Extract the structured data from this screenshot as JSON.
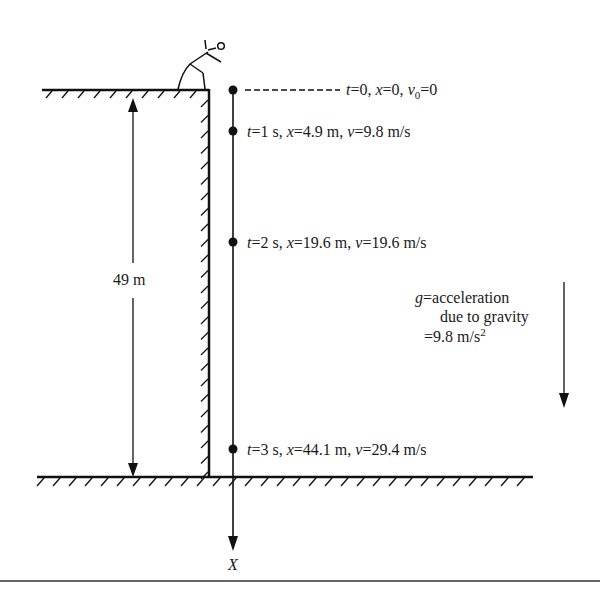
{
  "diagram": {
    "height_label": "49 m",
    "axis_label": "X",
    "points": [
      {
        "t_label": "t",
        "t_val": "=0, ",
        "x_label": "x",
        "x_val": "=0, ",
        "v_label": "v",
        "v_sub": "0",
        "v_val": "=0"
      },
      {
        "t_label": "t",
        "t_val": "=1 s, ",
        "x_label": "x",
        "x_val": "=4.9 m, ",
        "v_label": "v",
        "v_val": "=9.8 m/s"
      },
      {
        "t_label": "t",
        "t_val": "=2 s, ",
        "x_label": "x",
        "x_val": "=19.6 m, ",
        "v_label": "v",
        "v_val": "=19.6 m/s"
      },
      {
        "t_label": "t",
        "t_val": "=3 s, ",
        "x_label": "x",
        "x_val": "=44.1 m, ",
        "v_label": "v",
        "v_val": "=29.4 m/s"
      }
    ],
    "gravity": {
      "symbol": "g",
      "line1": "=acceleration",
      "line2": "due to gravity",
      "line3": "=9.8 m/s",
      "line3_sup": "2"
    }
  }
}
